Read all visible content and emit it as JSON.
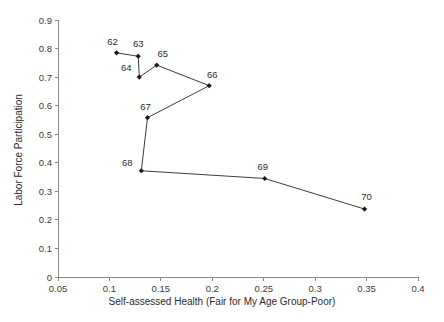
{
  "chart_data": {
    "type": "line",
    "title": "",
    "xlabel": "Self-assessed Health (Fair for My Age Group-Poor)",
    "ylabel": "Labor Force Participation",
    "xlim": [
      0.05,
      0.4
    ],
    "ylim": [
      0,
      0.9
    ],
    "grid": false,
    "legend": "none",
    "marker": "diamond",
    "xticks": [
      0.05,
      0.1,
      0.15,
      0.2,
      0.25,
      0.3,
      0.35,
      0.4
    ],
    "xtick_labels": [
      "0.05",
      "0.1",
      "0.15",
      "0.2",
      "0.25",
      "0.3",
      "0.35",
      "0.4"
    ],
    "yticks": [
      0,
      0.1,
      0.2,
      0.3,
      0.4,
      0.5,
      0.6,
      0.7,
      0.8,
      0.9
    ],
    "ytick_labels": [
      "0",
      "0.1",
      "0.2",
      "0.3",
      "0.4",
      "0.5",
      "0.6",
      "0.7",
      "0.8",
      "0.9"
    ],
    "point_labels": [
      "62",
      "63",
      "64",
      "65",
      "66",
      "67",
      "68",
      "69",
      "70"
    ],
    "x": [
      0.107,
      0.128,
      0.129,
      0.146,
      0.197,
      0.137,
      0.131,
      0.251,
      0.348
    ],
    "y": [
      0.785,
      0.773,
      0.7,
      0.742,
      0.67,
      0.558,
      0.372,
      0.345,
      0.238
    ],
    "points": [
      {
        "label": "62",
        "x": 0.107,
        "y": 0.785,
        "label_dx": -4,
        "label_dy": -8
      },
      {
        "label": "63",
        "x": 0.128,
        "y": 0.773,
        "label_dx": 0,
        "label_dy": -9
      },
      {
        "label": "64",
        "x": 0.129,
        "y": 0.7,
        "label_dx": -13,
        "label_dy": -6
      },
      {
        "label": "65",
        "x": 0.146,
        "y": 0.742,
        "label_dx": 6,
        "label_dy": -8
      },
      {
        "label": "66",
        "x": 0.197,
        "y": 0.67,
        "label_dx": 3,
        "label_dy": -8
      },
      {
        "label": "67",
        "x": 0.137,
        "y": 0.558,
        "label_dx": -2,
        "label_dy": -8
      },
      {
        "label": "68",
        "x": 0.131,
        "y": 0.372,
        "label_dx": -14,
        "label_dy": -5
      },
      {
        "label": "69",
        "x": 0.251,
        "y": 0.345,
        "label_dx": -2,
        "label_dy": -8
      },
      {
        "label": "70",
        "x": 0.348,
        "y": 0.238,
        "label_dx": 2,
        "label_dy": -9
      }
    ],
    "colors": {
      "line": "#3d3d3d",
      "marker": "#1a1a1a",
      "axis": "#8a8a8a",
      "text": "#2b2b2b",
      "background": "#ffffff"
    }
  }
}
